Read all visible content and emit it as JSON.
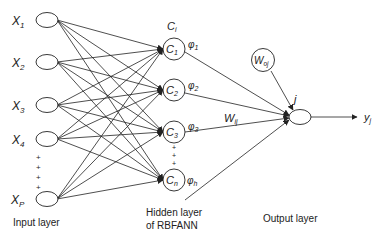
{
  "input_layer": {
    "label": "Input layer",
    "nodes": [
      {
        "name": "X",
        "sub": "1"
      },
      {
        "name": "X",
        "sub": "2"
      },
      {
        "name": "X",
        "sub": "3"
      },
      {
        "name": "X",
        "sub": "4"
      },
      {
        "name": "X",
        "sub": "P"
      }
    ]
  },
  "hidden_layer": {
    "label_line1": "Hidden layer",
    "label_line2": "of RBFANN",
    "center_label": "C",
    "center_label_sub": "i",
    "nodes": [
      {
        "name": "C",
        "sub": "1",
        "phi": "φ",
        "phi_sub": "1"
      },
      {
        "name": "C",
        "sub": "2",
        "phi": "φ",
        "phi_sub": "2"
      },
      {
        "name": "C",
        "sub": "3",
        "phi": "φ",
        "phi_sub": "3"
      },
      {
        "name": "C",
        "sub": "n",
        "phi": "φ",
        "phi_sub": "h"
      }
    ]
  },
  "weights": {
    "hidden_output": {
      "name": "W",
      "sub": "ij"
    },
    "bias": {
      "name": "W",
      "sub": "oj"
    }
  },
  "output_layer": {
    "label": "Output layer",
    "node_label": "j",
    "output": {
      "name": "y",
      "sub": "j"
    }
  },
  "ellipsis_marker": "+"
}
